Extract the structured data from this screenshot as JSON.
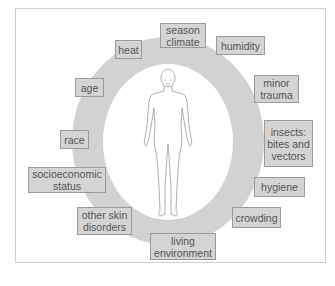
{
  "diagram": {
    "type": "factor-ring",
    "center": "human body figure (front view)",
    "colors": {
      "ring": "#d2d2d2",
      "box_fill": "#d4d4d4",
      "box_border": "#9a9a9a",
      "text": "#555555",
      "frame_border": "#cfcfcf"
    },
    "factors": [
      {
        "id": "season",
        "lines": [
          "season",
          "climate"
        ]
      },
      {
        "id": "humidity",
        "lines": [
          "humidity"
        ]
      },
      {
        "id": "minor-trauma",
        "lines": [
          "minor",
          "trauma"
        ]
      },
      {
        "id": "insects",
        "lines": [
          "insects:",
          "bites and",
          "vectors"
        ]
      },
      {
        "id": "hygiene",
        "lines": [
          "hygiene"
        ]
      },
      {
        "id": "crowding",
        "lines": [
          "crowding"
        ]
      },
      {
        "id": "living-environment",
        "lines": [
          "living",
          "environment"
        ]
      },
      {
        "id": "other-skin-disorders",
        "lines": [
          "other skin",
          "disorders"
        ]
      },
      {
        "id": "socioeconomic-status",
        "lines": [
          "socioeconomic",
          "status"
        ]
      },
      {
        "id": "race",
        "lines": [
          "race"
        ]
      },
      {
        "id": "age",
        "lines": [
          "age"
        ]
      },
      {
        "id": "heat",
        "lines": [
          "heat"
        ]
      }
    ]
  }
}
